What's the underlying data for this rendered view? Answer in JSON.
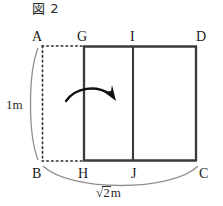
{
  "figure": {
    "caption": "図 2",
    "vertices": [
      {
        "name": "A",
        "label": "A",
        "x": 32,
        "y": 30
      },
      {
        "name": "G",
        "label": "G",
        "x": 77,
        "y": 30
      },
      {
        "name": "I",
        "label": "I",
        "x": 129,
        "y": 30
      },
      {
        "name": "D",
        "label": "D",
        "x": 196,
        "y": 30
      },
      {
        "name": "B",
        "label": "B",
        "x": 32,
        "y": 167
      },
      {
        "name": "H",
        "label": "H",
        "x": 78,
        "y": 167
      },
      {
        "name": "J",
        "label": "J",
        "x": 130,
        "y": 167
      },
      {
        "name": "C",
        "label": "C",
        "x": 198,
        "y": 167
      }
    ],
    "dimensions": {
      "left": {
        "label": "1m",
        "value": "1",
        "unit": "m"
      },
      "bottom": {
        "label": "√2m",
        "radicand": "2",
        "unit": "m"
      }
    },
    "geometry": {
      "solid_rect": {
        "left": 83,
        "top": 46,
        "right": 197,
        "bottom": 161
      },
      "inner_divider_x": 133,
      "dotted_rect": {
        "left": 42,
        "top": 46,
        "right": 83,
        "bottom": 161
      }
    },
    "annotations": {
      "rotation_arrow": "curved-arrow-right"
    },
    "colors": {
      "solid_line": "#3a3a3a",
      "dotted_line": "#2b2b2b",
      "brace_arc": "#8a8a8a",
      "arrow": "#111111",
      "text": "#1a1a1a",
      "background": "#ffffff"
    }
  }
}
